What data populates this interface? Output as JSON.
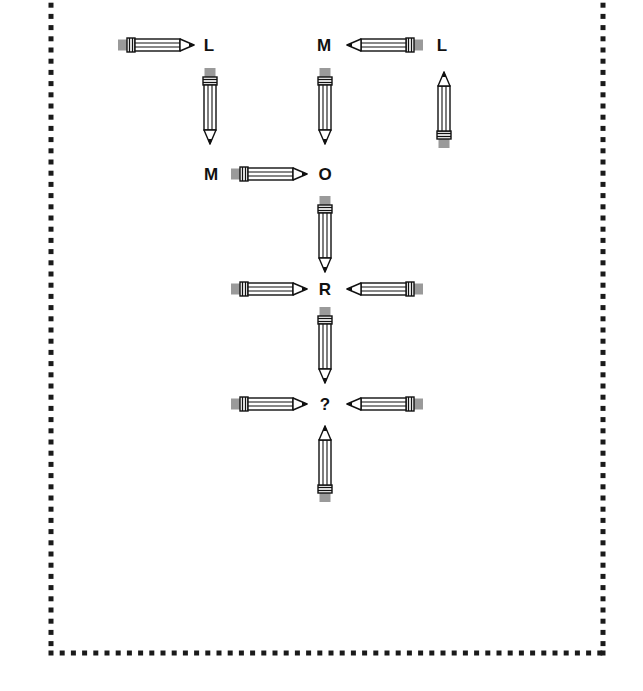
{
  "puzzle": {
    "title": "",
    "labels": [
      {
        "id": "l1",
        "text": "L",
        "x": 209,
        "y": 45
      },
      {
        "id": "m1",
        "text": "M",
        "x": 324,
        "y": 45
      },
      {
        "id": "l2",
        "text": "L",
        "x": 442,
        "y": 45
      },
      {
        "id": "m2",
        "text": "M",
        "x": 211,
        "y": 174
      },
      {
        "id": "o1",
        "text": "O",
        "x": 325,
        "y": 174
      },
      {
        "id": "r1",
        "text": "R",
        "x": 325,
        "y": 289
      },
      {
        "id": "q1",
        "text": "?",
        "x": 325,
        "y": 404
      }
    ],
    "pencils": [
      {
        "id": "p1",
        "direction": "right",
        "x": 118,
        "y": 45
      },
      {
        "id": "p2",
        "direction": "down",
        "x": 210,
        "y": 68
      },
      {
        "id": "p3",
        "direction": "left",
        "x": 423,
        "y": 45
      },
      {
        "id": "p4",
        "direction": "down",
        "x": 325,
        "y": 68
      },
      {
        "id": "p5",
        "direction": "up",
        "x": 444,
        "y": 148
      },
      {
        "id": "p6",
        "direction": "right",
        "x": 231,
        "y": 174
      },
      {
        "id": "p7",
        "direction": "down",
        "x": 325,
        "y": 196
      },
      {
        "id": "p8",
        "direction": "right",
        "x": 231,
        "y": 289
      },
      {
        "id": "p9",
        "direction": "left",
        "x": 423,
        "y": 289
      },
      {
        "id": "p10",
        "direction": "down",
        "x": 325,
        "y": 307
      },
      {
        "id": "p11",
        "direction": "right",
        "x": 231,
        "y": 404
      },
      {
        "id": "p12",
        "direction": "left",
        "x": 423,
        "y": 404
      },
      {
        "id": "p13",
        "direction": "up",
        "x": 325,
        "y": 502
      }
    ],
    "border": {
      "style": "dotted-squares",
      "left": 51,
      "top": -6,
      "right": 603,
      "bottom": 653,
      "color": "#1a1a1a"
    },
    "colors": {
      "eraser": "#9a9a9a",
      "outline": "#111111",
      "background": "#ffffff"
    }
  }
}
